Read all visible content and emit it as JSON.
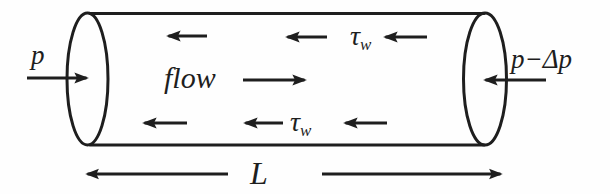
{
  "labels": {
    "pressure_left": "p",
    "pressure_right": "p−Δp",
    "flow": "flow",
    "tau": "τ",
    "tau_sub": "w",
    "length": "L"
  },
  "colors": {
    "ink": "#1e1e1e",
    "background": "#fefefe"
  }
}
